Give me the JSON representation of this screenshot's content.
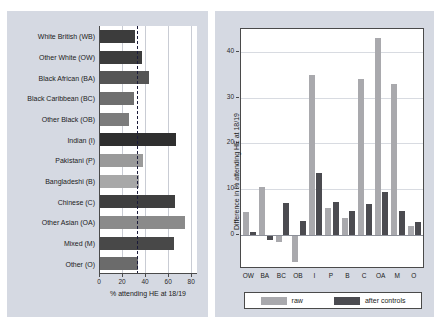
{
  "chart_data": [
    {
      "id": "left",
      "type": "bar",
      "orientation": "horizontal",
      "title": "",
      "xlabel": "% attending HE at 18/19",
      "ylabel": "",
      "xlim": [
        0,
        85
      ],
      "xticks": [
        0,
        20,
        40,
        60,
        80
      ],
      "grid": true,
      "reference_line": {
        "value": 33,
        "style": "dashed",
        "color": "#1b1b3a"
      },
      "categories": [
        "White British (WB)",
        "Other White (OW)",
        "Black African (BA)",
        "Black Caribbean (BC)",
        "Other Black (OB)",
        "Indian (I)",
        "Pakistani (P)",
        "Bangladeshi (B)",
        "Chinese (C)",
        "Other Asian (OA)",
        "Mixed (M)",
        "Other (O)"
      ],
      "values": [
        31,
        37,
        43,
        30,
        26,
        67,
        38,
        35,
        66,
        75,
        65,
        34
      ],
      "bar_colors": [
        "#3c3c3c",
        "#3c3c3c",
        "#555555",
        "#6f6f6f",
        "#7c7c7c",
        "#2f2f2f",
        "#9a9a9a",
        "#a8a8a8",
        "#3f3f3f",
        "#8a8a8a",
        "#484848",
        "#6b6b6b"
      ]
    },
    {
      "id": "right",
      "type": "bar",
      "orientation": "vertical",
      "title": "",
      "xlabel": "",
      "ylabel": "Difference in % attending HE at 18/19",
      "ylim": [
        -7,
        45
      ],
      "yticks": [
        0,
        10,
        20,
        30,
        40
      ],
      "grid": true,
      "categories": [
        "OW",
        "BA",
        "BC",
        "OB",
        "I",
        "P",
        "B",
        "C",
        "OA",
        "M",
        "O"
      ],
      "series": [
        {
          "name": "raw",
          "color": "#a9a9ad",
          "values": [
            5.0,
            10.5,
            -1.5,
            -6.0,
            35.0,
            6.0,
            3.8,
            34.0,
            43.0,
            33.0,
            2.0
          ]
        },
        {
          "name": "after controls",
          "color": "#4b4b50",
          "values": [
            0.6,
            -1.0,
            7.0,
            3.0,
            13.5,
            7.3,
            5.3,
            6.8,
            9.3,
            5.3,
            2.9
          ]
        }
      ]
    }
  ],
  "legend": {
    "items": [
      {
        "label": "raw",
        "color": "#a9a9ad"
      },
      {
        "label": "after controls",
        "color": "#4b4b50"
      }
    ]
  }
}
